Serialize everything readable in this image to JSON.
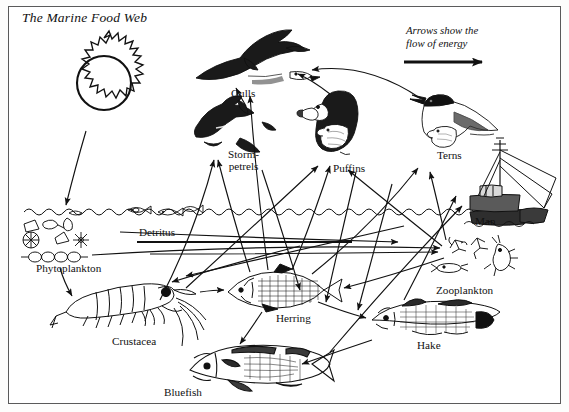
{
  "diagram": {
    "title": "The Marine Food Web",
    "legend": {
      "line1": "Arrows show the",
      "line2": "flow of energy",
      "arrow_icon": "right-arrow-icon"
    },
    "border_color": "#5a5a5a",
    "ink_color": "#111111",
    "background_color": "#ffffff"
  },
  "nodes": [
    {
      "id": "sun",
      "label": "",
      "icon": "sun-icon",
      "x": 58,
      "y": 38,
      "w": 92,
      "h": 92
    },
    {
      "id": "gulls",
      "label": "Gulls",
      "icon": "gull-bird-icon",
      "x": 196,
      "y": 43,
      "w": 120,
      "h": 48
    },
    {
      "id": "storm-petrels",
      "label": "Storm-\npetrels",
      "icon": "petrel-bird-icon",
      "x": 196,
      "y": 107,
      "w": 78,
      "h": 48
    },
    {
      "id": "puffins",
      "label": "Puffins",
      "icon": "puffin-bird-icon",
      "x": 312,
      "y": 92,
      "w": 62,
      "h": 66
    },
    {
      "id": "terns",
      "label": "Terns",
      "icon": "tern-bird-icon",
      "x": 412,
      "y": 96,
      "w": 88,
      "h": 58
    },
    {
      "id": "man",
      "label": "Man",
      "icon": "fishing-boat-icon",
      "x": 463,
      "y": 148,
      "w": 92,
      "h": 70
    },
    {
      "id": "detritus",
      "label": "Detritus",
      "icon": "detritus-line-icon",
      "x": 137,
      "y": 198,
      "w": 215,
      "h": 20
    },
    {
      "id": "phytoplankton",
      "label": "Phytoplankton",
      "icon": "diatom-cluster-icon",
      "x": 22,
      "y": 212,
      "w": 104,
      "h": 52
    },
    {
      "id": "zooplankton",
      "label": "Zooplankton",
      "icon": "copepod-icon",
      "x": 443,
      "y": 238,
      "w": 88,
      "h": 44
    },
    {
      "id": "crustacea",
      "label": "Crustacea",
      "icon": "krill-shrimp-icon",
      "x": 62,
      "y": 282,
      "w": 160,
      "h": 66
    },
    {
      "id": "herring",
      "label": "Herring",
      "icon": "herring-fish-icon",
      "x": 224,
      "y": 272,
      "w": 120,
      "h": 46
    },
    {
      "id": "hake",
      "label": "Hake",
      "icon": "hake-fish-icon",
      "x": 368,
      "y": 300,
      "w": 128,
      "h": 42
    },
    {
      "id": "bluefish",
      "label": "Bluefish",
      "icon": "bluefish-fish-icon",
      "x": 186,
      "y": 345,
      "w": 146,
      "h": 48
    }
  ],
  "labels": {
    "gulls": "Gulls",
    "storm_petrels_line1": "Storm-",
    "storm_petrels_line2": "petrels",
    "puffins": "Puffins",
    "terns": "Terns",
    "man": "Man",
    "detritus": "Detritus",
    "phytoplankton": "Phytoplankton",
    "zooplankton": "Zooplankton",
    "crustacea": "Crustacea",
    "herring": "Herring",
    "hake": "Hake",
    "bluefish": "Bluefish"
  },
  "energy_flow_edges": [
    {
      "from": "sun",
      "to": "phytoplankton"
    },
    {
      "from": "phytoplankton",
      "to": "zooplankton"
    },
    {
      "from": "phytoplankton",
      "to": "crustacea"
    },
    {
      "from": "phytoplankton",
      "to": "detritus"
    },
    {
      "from": "zooplankton",
      "to": "herring"
    },
    {
      "from": "crustacea",
      "to": "herring"
    },
    {
      "from": "crustacea",
      "to": "storm-petrels"
    },
    {
      "from": "crustacea",
      "to": "puffins"
    },
    {
      "from": "detritus",
      "to": "crustacea"
    },
    {
      "from": "detritus",
      "to": "zooplankton"
    },
    {
      "from": "herring",
      "to": "gulls"
    },
    {
      "from": "herring",
      "to": "puffins"
    },
    {
      "from": "herring",
      "to": "terns"
    },
    {
      "from": "herring",
      "to": "hake"
    },
    {
      "from": "herring",
      "to": "bluefish"
    },
    {
      "from": "herring",
      "to": "man"
    },
    {
      "from": "hake",
      "to": "man"
    },
    {
      "from": "hake",
      "to": "bluefish"
    },
    {
      "from": "bluefish",
      "to": "man"
    },
    {
      "from": "terns",
      "to": "gulls"
    },
    {
      "from": "puffins",
      "to": "gulls"
    },
    {
      "from": "storm-petrels",
      "to": "gulls"
    },
    {
      "from": "zooplankton",
      "to": "terns"
    },
    {
      "from": "zooplankton",
      "to": "puffins"
    }
  ]
}
